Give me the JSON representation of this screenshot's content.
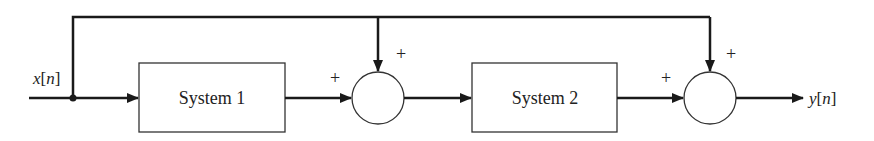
{
  "diagram": {
    "type": "block-diagram",
    "input": {
      "var": "x",
      "idx": "n",
      "open": "[",
      "close": "]"
    },
    "output": {
      "var": "y",
      "idx": "n",
      "open": "[",
      "close": "]"
    },
    "blocks": [
      {
        "id": "system-1",
        "label": "System 1"
      },
      {
        "id": "system-2",
        "label": "System 2"
      }
    ],
    "summers": [
      {
        "id": "summer-1",
        "signs": {
          "left": "+",
          "top": "+"
        }
      },
      {
        "id": "summer-2",
        "signs": {
          "left": "+",
          "top": "+"
        }
      }
    ],
    "connections": [
      "x[n] -> System 1",
      "System 1 -> summer-1 (+)",
      "x[n] -> summer-1 (+) via top feedforward",
      "summer-1 -> System 2",
      "System 2 -> summer-2 (+)",
      "x[n] -> summer-2 (+) via top feedforward",
      "summer-2 -> y[n]"
    ],
    "colors": {
      "stroke": "#1a1a1a",
      "background": "#ffffff"
    }
  }
}
